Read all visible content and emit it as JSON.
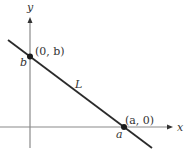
{
  "diagram": {
    "type": "coordinate-plane-line",
    "axes": {
      "x_label": "x",
      "y_label": "y"
    },
    "line": {
      "label": "L"
    },
    "points": [
      {
        "id": "y-intercept",
        "label": "(0, b)",
        "axis_tick": "b"
      },
      {
        "id": "x-intercept",
        "label": "(a, 0)",
        "axis_tick": "a"
      }
    ],
    "colors": {
      "axis": "#8a8a8a",
      "line": "#2b2b2b",
      "point": "#1a1a1a",
      "text": "#333333"
    }
  }
}
